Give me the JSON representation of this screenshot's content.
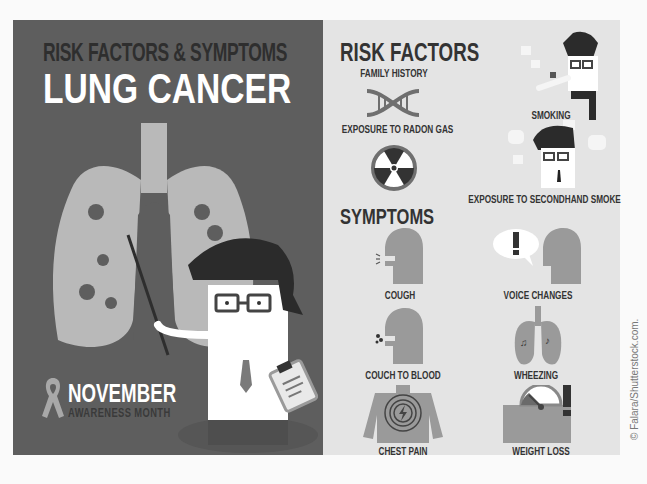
{
  "left_panel": {
    "subtitle": "RISK FACTORS & SYMPTOMS",
    "title": "LUNG CANCER",
    "awareness": {
      "month": "NOVEMBER",
      "caption": "AWARENESS MONTH"
    }
  },
  "risk_factors": {
    "heading": "RISK FACTORS",
    "items": [
      {
        "label": "FAMILY HISTORY",
        "icon": "dna-icon"
      },
      {
        "label": "EXPOSURE TO RADON GAS",
        "icon": "radiation-icon"
      },
      {
        "label": "SMOKING",
        "icon": "smoking-man-icon"
      },
      {
        "label": "EXPOSURE TO SECONDHAND SMOKE",
        "icon": "secondhand-smoke-icon"
      }
    ]
  },
  "symptoms": {
    "heading": "SYMPTOMS",
    "items": [
      {
        "label": "COUGH",
        "icon": "cough-icon"
      },
      {
        "label": "VOICE CHANGES",
        "icon": "voice-changes-icon"
      },
      {
        "label": "COUCH TO BLOOD",
        "icon": "cough-blood-icon"
      },
      {
        "label": "WHEEZING",
        "icon": "wheezing-lungs-icon"
      },
      {
        "label": "CHEST PAIN",
        "icon": "chest-pain-icon"
      },
      {
        "label": "WEIGHT LOSS",
        "icon": "weight-loss-icon"
      }
    ]
  },
  "credit": "© Falara/Shutterstock.com.",
  "colors": {
    "dark_panel": "#5e5e5e",
    "light_panel": "#e4e4e4",
    "text_dark": "#333333",
    "white": "#ffffff",
    "icon_gray": "#9a9a9a"
  }
}
